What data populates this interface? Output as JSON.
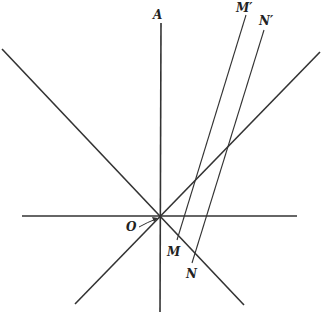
{
  "diagram": {
    "labels": {
      "A": "A",
      "O": "O",
      "M": "M",
      "N": "N",
      "M_prime": "M′",
      "N_prime": "N′"
    },
    "origin": [
      160,
      216
    ],
    "lines": {
      "vertical_axis": [
        [
          161,
          23
        ],
        [
          160,
          312
        ]
      ],
      "horizontal_axis": [
        [
          22,
          216
        ],
        [
          297,
          216
        ]
      ],
      "diagonal_down": [
        [
          2,
          49
        ],
        [
          244,
          305
        ]
      ],
      "diagonal_up": [
        [
          320,
          52
        ],
        [
          75,
          304
        ]
      ],
      "MM_prime": [
        [
          177,
          240
        ],
        [
          246,
          15
        ]
      ],
      "NN_prime": [
        [
          192,
          263
        ],
        [
          264,
          30
        ]
      ]
    },
    "colors": {
      "line": "#333333",
      "text": "#222222"
    }
  }
}
